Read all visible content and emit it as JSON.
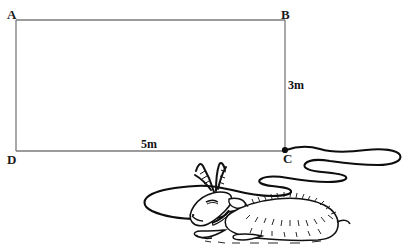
{
  "figure": {
    "type": "geometry-diagram",
    "background_color": "#ffffff",
    "line_color": "#7a7a7a",
    "ink_color": "#111111",
    "vertices": [
      {
        "id": "A",
        "label": "A",
        "x": 16,
        "y": 20
      },
      {
        "id": "B",
        "label": "B",
        "x": 285,
        "y": 20
      },
      {
        "id": "C",
        "label": "C",
        "x": 285,
        "y": 151
      },
      {
        "id": "D",
        "label": "D",
        "x": 16,
        "y": 151
      }
    ],
    "dimensions": [
      {
        "id": "width",
        "label": "5m",
        "value": 5,
        "unit": "m",
        "edge": "DC",
        "x": 141,
        "y": 138
      },
      {
        "id": "height",
        "label": "3m",
        "value": 3,
        "unit": "m",
        "edge": "BC",
        "x": 288,
        "y": 79
      }
    ],
    "tether_point": {
      "label": "C",
      "x": 285,
      "y": 151,
      "marker": "filled-dot"
    },
    "animal": {
      "name": "goat",
      "pose": "lying-down",
      "has_collar": true,
      "horns": 2
    },
    "rope": {
      "name": "tether-rope",
      "attached_at": "C",
      "shape": "serpentine-coiled"
    }
  }
}
